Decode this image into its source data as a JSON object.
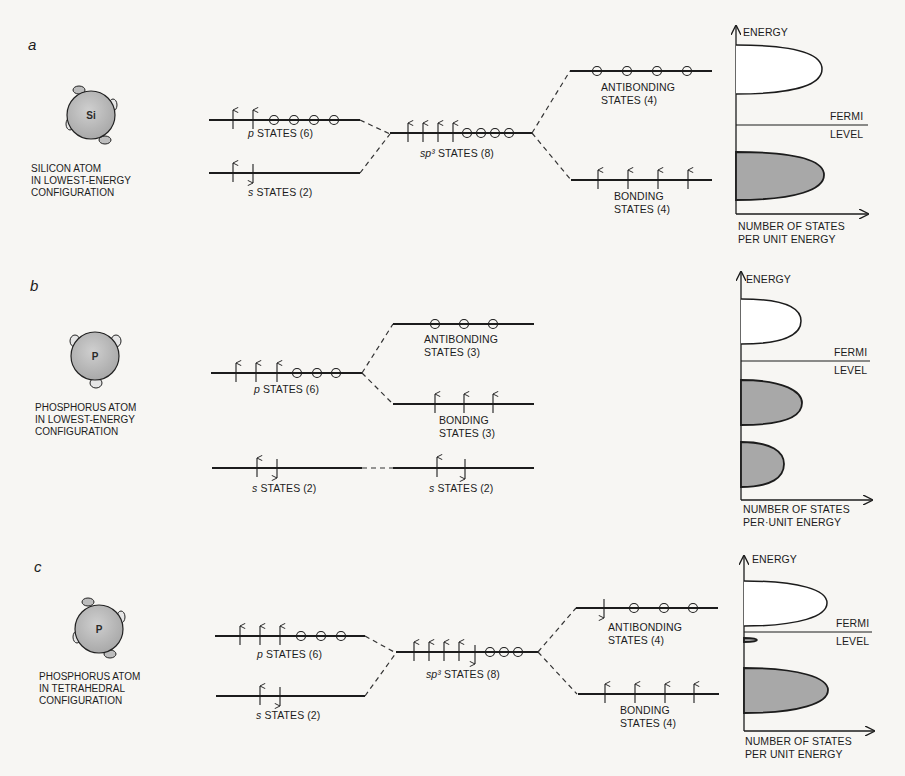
{
  "figure": {
    "colors": {
      "background": "#f7f6f3",
      "ink": "#1c1c1c",
      "atom_fill": "#bdbdbd",
      "filled_band": "#a8a8a8",
      "empty_band": "#ffffff"
    },
    "panels": [
      {
        "letter": "a",
        "atom": {
          "symbol": "Si",
          "caption": [
            "SILICON ATOM",
            "IN LOWEST-ENERGY",
            "CONFIGURATION"
          ]
        },
        "levels": [
          {
            "id": "p",
            "prefix": "p",
            "label": " STATES (6)",
            "electrons": [
              "up",
              "up"
            ],
            "holes": 4
          },
          {
            "id": "s",
            "prefix": "s",
            "label": " STATES (2)",
            "electrons": [
              "up",
              "down"
            ],
            "holes": 0
          },
          {
            "id": "sp3",
            "prefix": "sp³",
            "label": " STATES (8)",
            "electrons": [
              "up",
              "up",
              "up",
              "up"
            ],
            "holes": 4
          },
          {
            "id": "antibonding",
            "label_lines": [
              "ANTIBONDING",
              "STATES (4)"
            ],
            "electrons": [],
            "holes": 4
          },
          {
            "id": "bonding",
            "label_lines": [
              "BONDING",
              "STATES (4)"
            ],
            "electrons": [
              "up",
              "up",
              "up",
              "up"
            ],
            "holes": 0
          }
        ],
        "dos": {
          "axis_y_label": "ENERGY",
          "fermi_label": [
            "FERMI",
            "LEVEL"
          ],
          "axis_x_label": [
            "NUMBER OF STATES",
            "PER UNIT ENERGY"
          ],
          "bands": [
            {
              "type": "empty",
              "role": "conduction"
            },
            {
              "type": "filled",
              "role": "valence"
            }
          ]
        }
      },
      {
        "letter": "b",
        "atom": {
          "symbol": "P",
          "caption": [
            "PHOSPHORUS ATOM",
            "IN LOWEST-ENERGY",
            "CONFIGURATION"
          ]
        },
        "levels": [
          {
            "id": "p",
            "prefix": "p",
            "label": " STATES (6)",
            "electrons": [
              "up",
              "up",
              "up"
            ],
            "holes": 3
          },
          {
            "id": "s",
            "prefix": "s",
            "label": " STATES (2)",
            "electrons": [
              "up",
              "down"
            ],
            "holes": 0
          },
          {
            "id": "antibonding",
            "label_lines": [
              "ANTIBONDING",
              "STATES (3)"
            ],
            "electrons": [],
            "holes": 3
          },
          {
            "id": "bonding",
            "label_lines": [
              "BONDING",
              "STATES (3)"
            ],
            "electrons": [
              "up",
              "up",
              "up"
            ],
            "holes": 0
          },
          {
            "id": "s2",
            "prefix": "s",
            "label": " STATES (2)",
            "electrons": [
              "up",
              "down"
            ],
            "holes": 0
          }
        ],
        "dos": {
          "axis_y_label": "ENERGY",
          "fermi_label": [
            "FERMI",
            "LEVEL"
          ],
          "axis_x_label": [
            "NUMBER OF STATES",
            "PER·UNIT ENERGY"
          ],
          "bands": [
            {
              "type": "empty",
              "role": "antibonding"
            },
            {
              "type": "filled",
              "role": "bonding"
            },
            {
              "type": "filled",
              "role": "s"
            }
          ]
        }
      },
      {
        "letter": "c",
        "atom": {
          "symbol": "P",
          "caption": [
            "PHOSPHORUS ATOM",
            "IN TETRAHEDRAL",
            "CONFIGURATION"
          ]
        },
        "levels": [
          {
            "id": "p",
            "prefix": "p",
            "label": " STATES (6)",
            "electrons": [
              "up",
              "up",
              "up"
            ],
            "holes": 3
          },
          {
            "id": "s",
            "prefix": "s",
            "label": " STATES (2)",
            "electrons": [
              "up",
              "down"
            ],
            "holes": 0
          },
          {
            "id": "sp3",
            "prefix": "sp³",
            "label": " STATES (8)",
            "electrons": [
              "up",
              "up",
              "up",
              "up",
              "down"
            ],
            "holes": 3
          },
          {
            "id": "antibonding",
            "label_lines": [
              "ANTIBONDING",
              "STATES (4)"
            ],
            "electrons": [
              "down"
            ],
            "holes": 3
          },
          {
            "id": "bonding",
            "label_lines": [
              "BONDING",
              "STATES (4)"
            ],
            "electrons": [
              "up",
              "up",
              "up",
              "up"
            ],
            "holes": 0
          }
        ],
        "dos": {
          "axis_y_label": "ENERGY",
          "fermi_label": [
            "FERMI",
            "LEVEL"
          ],
          "axis_x_label": [
            "NUMBER OF STATES",
            "PER UNIT ENERGY"
          ],
          "bands": [
            {
              "type": "empty",
              "role": "conduction"
            },
            {
              "type": "filled",
              "role": "donor-level"
            },
            {
              "type": "filled",
              "role": "valence"
            }
          ]
        }
      }
    ]
  }
}
